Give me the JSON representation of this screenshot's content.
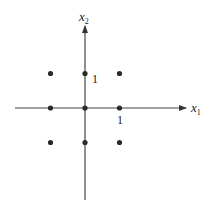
{
  "diagram": {
    "type": "integer-lattice",
    "colors": {
      "ink": "#333333",
      "background": "#ffffff"
    },
    "axes": {
      "x": {
        "label": "x",
        "subscript": "1",
        "tick_label": "1"
      },
      "y": {
        "label": "x",
        "subscript": "2",
        "tick_label": "1"
      }
    },
    "points": [
      {
        "x": -1,
        "y": 1
      },
      {
        "x": 0,
        "y": 1
      },
      {
        "x": 1,
        "y": 1
      },
      {
        "x": -1,
        "y": 0
      },
      {
        "x": 0,
        "y": 0
      },
      {
        "x": 1,
        "y": 0
      },
      {
        "x": -1,
        "y": -1
      },
      {
        "x": 0,
        "y": -1
      },
      {
        "x": 1,
        "y": -1
      }
    ]
  }
}
